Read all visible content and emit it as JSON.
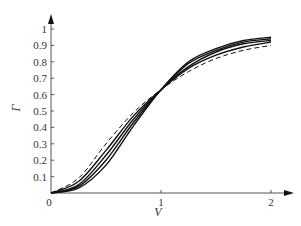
{
  "chart_data": {
    "type": "line",
    "title": "",
    "xlabel": "V",
    "ylabel": "Γ",
    "xlim": [
      0,
      2
    ],
    "ylim": [
      0,
      1
    ],
    "grid": false,
    "legend": null,
    "x_ticks": [
      "0",
      "1",
      "2"
    ],
    "y_ticks": [
      "0.1",
      "0.2",
      "0.3",
      "0.4",
      "0.5",
      "0.6",
      "0.7",
      "0.8",
      "0.9",
      "1"
    ],
    "x": [
      0,
      0.25,
      0.5,
      0.75,
      1.0,
      1.25,
      1.5,
      1.75,
      2.0
    ],
    "series": [
      {
        "name": "dashed",
        "style": "dashed",
        "values": [
          0,
          0.09,
          0.3,
          0.49,
          0.63,
          0.74,
          0.82,
          0.87,
          0.9
        ]
      },
      {
        "name": "solid-1",
        "style": "solid",
        "values": [
          0,
          0.07,
          0.26,
          0.47,
          0.63,
          0.76,
          0.84,
          0.89,
          0.92
        ]
      },
      {
        "name": "solid-2",
        "style": "solid",
        "values": [
          0,
          0.05,
          0.23,
          0.45,
          0.63,
          0.77,
          0.86,
          0.91,
          0.93
        ]
      },
      {
        "name": "solid-3",
        "style": "solid",
        "values": [
          0,
          0.04,
          0.2,
          0.43,
          0.63,
          0.79,
          0.87,
          0.92,
          0.94
        ]
      },
      {
        "name": "solid-4",
        "style": "solid",
        "values": [
          0,
          0.03,
          0.17,
          0.41,
          0.63,
          0.8,
          0.88,
          0.93,
          0.95
        ]
      }
    ],
    "origin_label": "0"
  },
  "colors": {
    "axis": "#555555",
    "line": "#111111",
    "text": "#333333"
  }
}
